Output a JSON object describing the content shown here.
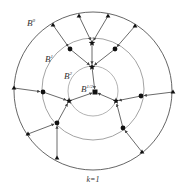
{
  "diagram": {
    "caption": "k=1",
    "labels": {
      "b0": {
        "base": "B",
        "sup": "0"
      },
      "b1": {
        "base": "B",
        "sup": "1"
      },
      "b2": {
        "base": "B",
        "sup": "2"
      },
      "b3": {
        "base": "B",
        "sup": "1/2"
      }
    },
    "circles": [
      {
        "name": "B0",
        "cx": 93,
        "cy": 91,
        "r": 79,
        "color": "#555555"
      },
      {
        "name": "B1",
        "cx": 93,
        "cy": 89,
        "r": 51,
        "color": "#999999"
      },
      {
        "name": "B2",
        "cx": 93,
        "cy": 91,
        "r": 25,
        "color": "#aaaaaa"
      }
    ],
    "center_node": {
      "shape": "square",
      "x": 95,
      "y": 92
    },
    "triangles": [
      [
        79,
        16
      ],
      [
        108,
        16
      ],
      [
        53,
        25
      ],
      [
        135,
        26
      ],
      [
        14,
        88
      ],
      [
        173,
        92
      ],
      [
        28,
        134
      ],
      [
        57,
        158
      ],
      [
        142,
        152
      ]
    ],
    "circle_nodes": [
      [
        70,
        49
      ],
      [
        115,
        49
      ],
      [
        43,
        92
      ],
      [
        141,
        96
      ],
      [
        57,
        123
      ],
      [
        123,
        128
      ]
    ],
    "stars": [
      [
        92,
        43
      ],
      [
        92,
        67
      ],
      [
        69,
        101
      ],
      [
        116,
        101
      ]
    ],
    "edges": [
      [
        [
          79,
          16
        ],
        [
          92,
          43
        ]
      ],
      [
        [
          108,
          16
        ],
        [
          92,
          43
        ]
      ],
      [
        [
          53,
          25
        ],
        [
          70,
          49
        ]
      ],
      [
        [
          135,
          26
        ],
        [
          115,
          49
        ]
      ],
      [
        [
          14,
          88
        ],
        [
          43,
          92
        ]
      ],
      [
        [
          173,
          92
        ],
        [
          141,
          96
        ]
      ],
      [
        [
          28,
          134
        ],
        [
          57,
          123
        ]
      ],
      [
        [
          57,
          158
        ],
        [
          57,
          123
        ]
      ],
      [
        [
          142,
          152
        ],
        [
          123,
          128
        ]
      ],
      [
        [
          92,
          43
        ],
        [
          92,
          67
        ]
      ],
      [
        [
          70,
          49
        ],
        [
          92,
          67
        ]
      ],
      [
        [
          115,
          49
        ],
        [
          92,
          67
        ]
      ],
      [
        [
          43,
          92
        ],
        [
          69,
          101
        ]
      ],
      [
        [
          57,
          123
        ],
        [
          69,
          101
        ]
      ],
      [
        [
          141,
          96
        ],
        [
          116,
          101
        ]
      ],
      [
        [
          123,
          128
        ],
        [
          116,
          101
        ]
      ],
      [
        [
          92,
          67
        ],
        [
          95,
          92
        ]
      ],
      [
        [
          69,
          101
        ],
        [
          95,
          92
        ]
      ],
      [
        [
          116,
          101
        ],
        [
          95,
          92
        ]
      ]
    ]
  }
}
